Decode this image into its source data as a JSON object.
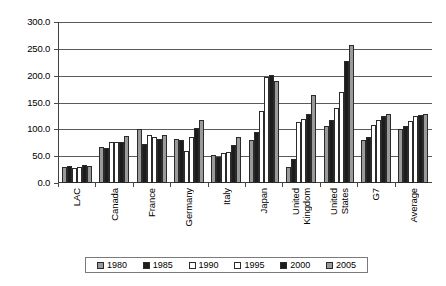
{
  "chart_data": {
    "type": "bar",
    "title": "",
    "subtitle": "",
    "xlabel": "",
    "ylabel": "",
    "ylim": [
      0,
      300
    ],
    "ytick_step": 50,
    "yticks": [
      "0.0",
      "50.0",
      "100.0",
      "150.0",
      "200.0",
      "250.0",
      "300.0"
    ],
    "grid": true,
    "legend_position": "bottom",
    "categories": [
      "LAC",
      "Canada",
      "France",
      "Germany",
      "Italy",
      "Japan",
      "United Kingdom",
      "United States",
      "G7",
      "Average"
    ],
    "series": [
      {
        "name": "1980",
        "color": "#9a9a9a",
        "values": [
          30,
          67,
          101,
          82,
          53,
          80,
          30,
          107,
          80,
          100
        ]
      },
      {
        "name": "1985",
        "color": "#1c1c1c",
        "values": [
          31,
          66,
          72,
          80,
          49,
          95,
          44,
          118,
          85,
          106
        ]
      },
      {
        "name": "1990",
        "color": "#ffffff",
        "values": [
          28,
          76,
          89,
          60,
          56,
          135,
          113,
          140,
          108,
          116
        ]
      },
      {
        "name": "1995",
        "color": "#ffffff",
        "values": [
          30,
          76,
          85,
          85,
          57,
          197,
          120,
          170,
          118,
          124
        ]
      },
      {
        "name": "2000",
        "color": "#1c1c1c",
        "values": [
          33,
          76,
          82,
          102,
          70,
          202,
          128,
          228,
          125,
          127
        ]
      },
      {
        "name": "2005",
        "color": "#9a9a9a",
        "values": [
          32,
          88,
          90,
          118,
          85,
          190,
          164,
          258,
          128,
          128
        ]
      }
    ]
  },
  "legend": {
    "items": [
      {
        "label": "1980",
        "color": "#9a9a9a"
      },
      {
        "label": "1985",
        "color": "#1c1c1c"
      },
      {
        "label": "1990",
        "color": "#ffffff"
      },
      {
        "label": "1995",
        "color": "#ffffff"
      },
      {
        "label": "2000",
        "color": "#1c1c1c"
      },
      {
        "label": "2005",
        "color": "#9a9a9a"
      }
    ]
  },
  "axis": {
    "y_labels": [
      "300.0",
      "250.0",
      "200.0",
      "150.0",
      "100.0",
      "50.0",
      "0.0"
    ]
  },
  "x_category_lines": [
    [
      "LAC"
    ],
    [
      "Canada"
    ],
    [
      "France"
    ],
    [
      "Germany"
    ],
    [
      "Italy"
    ],
    [
      "Japan"
    ],
    [
      "United",
      "Kingdom"
    ],
    [
      "United",
      "States"
    ],
    [
      "G7"
    ],
    [
      "Average"
    ]
  ]
}
